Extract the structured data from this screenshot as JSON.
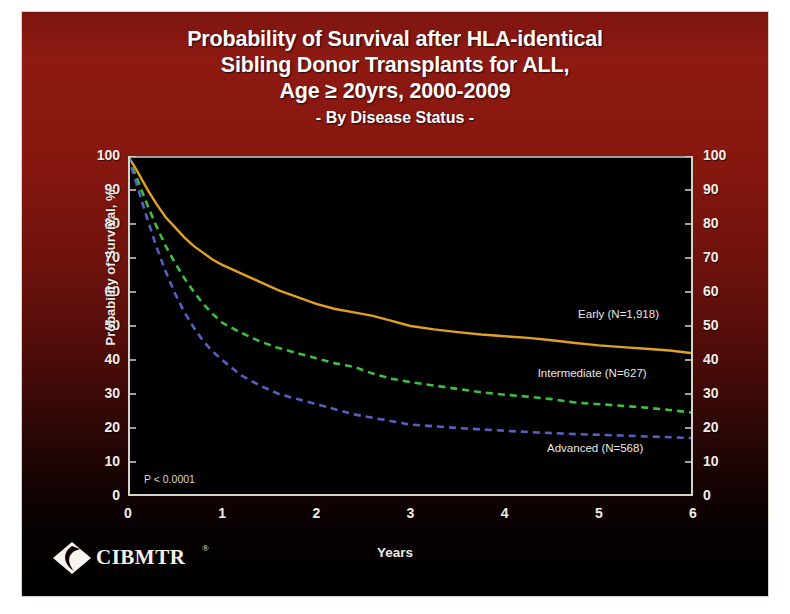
{
  "slide": {
    "title_lines": [
      "Probability of Survival after HLA-identical",
      "Sibling Donor Transplants for ALL,",
      "Age ≥ 20yrs, 2000-2009"
    ],
    "subtitle": "- By Disease Status -",
    "pvalue": "P < 0.0001",
    "logo_text": "CIBMTR",
    "logo_registered": "®",
    "background_top_color": "#8b1a12",
    "background_bottom_color": "#000000",
    "plot_background": "#000000",
    "axis_color": "#d8d2cc"
  },
  "chart_data": {
    "type": "line",
    "title": "Probability of Survival after HLA-identical Sibling Donor Transplants for ALL, Age ≥ 20yrs, 2000-2009",
    "subtitle": "- By Disease Status -",
    "xlabel": "Years",
    "ylabel": "Probability of Survival, %",
    "xlim": [
      0,
      6
    ],
    "ylim": [
      0,
      100
    ],
    "xticks": [
      0,
      1,
      2,
      3,
      4,
      5,
      6
    ],
    "xticklabels": [
      "0",
      "1",
      "2",
      "3",
      "4",
      "5",
      "6"
    ],
    "xminorticks": [
      0.5,
      1.5,
      2.5,
      3.5,
      4.5,
      5.5
    ],
    "yticks": [
      0,
      10,
      20,
      30,
      40,
      50,
      60,
      70,
      80,
      90,
      100
    ],
    "yticklabels": [
      "0",
      "10",
      "20",
      "30",
      "40",
      "50",
      "60",
      "70",
      "80",
      "90",
      "100"
    ],
    "grid": false,
    "legend": "inline-labels",
    "annotations": [
      "P < 0.0001"
    ],
    "series": [
      {
        "name": "Early",
        "label": "Early (N=1,918)",
        "n": 1918,
        "color": "#e0a020",
        "linestyle": "solid",
        "label_x": 4.78,
        "label_y": 53.0,
        "x": [
          0,
          0.1,
          0.2,
          0.3,
          0.4,
          0.5,
          0.6,
          0.7,
          0.8,
          0.9,
          1.0,
          1.2,
          1.4,
          1.6,
          1.8,
          2.0,
          2.2,
          2.4,
          2.6,
          2.8,
          3.0,
          3.25,
          3.5,
          3.75,
          4.0,
          4.25,
          4.5,
          4.75,
          5.0,
          5.25,
          5.5,
          5.75,
          6.0
        ],
        "y": [
          100,
          95.5,
          90.5,
          86.0,
          82.0,
          79.0,
          76.0,
          73.5,
          71.5,
          69.5,
          68.0,
          65.5,
          63.0,
          60.5,
          58.5,
          56.5,
          55.0,
          54.0,
          53.0,
          51.5,
          50.0,
          49.0,
          48.2,
          47.5,
          47.0,
          46.5,
          45.8,
          45.0,
          44.3,
          43.8,
          43.3,
          42.8,
          42.0
        ]
      },
      {
        "name": "Intermediate",
        "label": "Intermediate (N=627)",
        "n": 627,
        "color": "#3fbf3f",
        "linestyle": "dashed",
        "label_x": 4.35,
        "label_y": 35.5,
        "x": [
          0,
          0.1,
          0.2,
          0.3,
          0.4,
          0.5,
          0.6,
          0.7,
          0.8,
          0.9,
          1.0,
          1.2,
          1.4,
          1.6,
          1.8,
          2.0,
          2.2,
          2.4,
          2.6,
          2.8,
          3.0,
          3.25,
          3.5,
          3.75,
          4.0,
          4.25,
          4.5,
          4.75,
          5.0,
          5.25,
          5.5,
          5.75,
          6.0
        ],
        "y": [
          100,
          93.0,
          86.0,
          79.5,
          73.5,
          68.5,
          64.0,
          60.0,
          56.5,
          53.5,
          51.0,
          48.0,
          45.5,
          43.5,
          42.0,
          40.5,
          39.0,
          38.0,
          36.0,
          34.5,
          33.5,
          32.5,
          31.5,
          30.5,
          29.8,
          29.2,
          28.5,
          27.5,
          27.0,
          26.5,
          26.0,
          25.3,
          24.5
        ]
      },
      {
        "name": "Advanced",
        "label": "Advanced (N=568)",
        "n": 568,
        "color": "#5560c0",
        "linestyle": "dashed",
        "label_x": 4.45,
        "label_y": 13.5,
        "x": [
          0,
          0.1,
          0.2,
          0.3,
          0.4,
          0.5,
          0.6,
          0.7,
          0.8,
          0.9,
          1.0,
          1.2,
          1.4,
          1.6,
          1.8,
          2.0,
          2.2,
          2.4,
          2.6,
          2.8,
          3.0,
          3.25,
          3.5,
          3.75,
          4.0,
          4.25,
          4.5,
          4.75,
          5.0,
          5.25,
          5.5,
          5.75,
          6.0
        ],
        "y": [
          100,
          91.0,
          82.0,
          73.5,
          66.0,
          59.5,
          54.0,
          49.5,
          45.5,
          42.5,
          40.0,
          35.5,
          32.5,
          30.0,
          28.5,
          27.0,
          25.5,
          24.0,
          23.0,
          22.0,
          21.0,
          20.5,
          20.0,
          19.6,
          19.2,
          18.8,
          18.5,
          18.2,
          18.0,
          17.8,
          17.5,
          17.3,
          17.0
        ]
      }
    ]
  }
}
